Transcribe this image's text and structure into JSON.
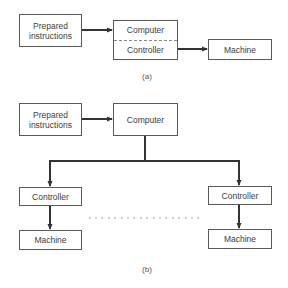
{
  "diagram_a": {
    "caption": "(a)",
    "prepared_instructions": "Prepared instructions",
    "computer": "Computer",
    "controller": "Controller",
    "machine": "Machine"
  },
  "diagram_b": {
    "caption": "(b)",
    "prepared_instructions": "Prepared instructions",
    "computer": "Computer",
    "controllers": [
      "Controller",
      "Controller"
    ],
    "machines": [
      "Machine",
      "Machine"
    ]
  },
  "colors": {
    "line": "#333333",
    "box_border": "#5a5a5a",
    "text": "#3d3d3d"
  }
}
